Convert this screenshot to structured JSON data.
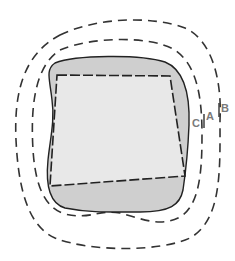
{
  "diagram": {
    "labels": {
      "a": "A",
      "b": "B",
      "c": "C"
    },
    "colors": {
      "background": "#ffffff",
      "shaded_region": "#cfcfcf",
      "inner_region": "#e8e8e8",
      "outline": "#222222",
      "label": "#7a7a7a"
    }
  }
}
